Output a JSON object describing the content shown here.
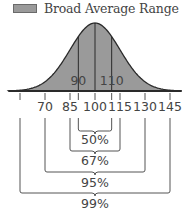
{
  "chart_data": {
    "type": "area",
    "title": "",
    "subtitle": "",
    "legend": [
      {
        "label": "Broad Average Range",
        "color": "#9a9a9a"
      }
    ],
    "legend_position": "top",
    "xlabel": "",
    "ylabel": "",
    "grid": false,
    "mean": 100,
    "sd": 15,
    "x_ticks": [
      55,
      70,
      85,
      90,
      100,
      110,
      115,
      130,
      145
    ],
    "x_tick_labels": [
      "",
      "70",
      "85",
      "",
      "100",
      "",
      "115",
      "130",
      "145"
    ],
    "inner_labels": [
      {
        "x": 90,
        "label": "90"
      },
      {
        "x": 110,
        "label": "110"
      }
    ],
    "vertical_lines": [
      90,
      100,
      110
    ],
    "ranges": [
      {
        "from": 90,
        "to": 110,
        "label": "50%",
        "percent": 50
      },
      {
        "from": 85,
        "to": 115,
        "label": "67%",
        "percent": 67
      },
      {
        "from": 70,
        "to": 130,
        "label": "95%",
        "percent": 95
      },
      {
        "from": 55,
        "to": 145,
        "label": "99%",
        "percent": 99
      }
    ],
    "colors": {
      "fill": "#9a9a9a",
      "stroke": "#2a2a2a",
      "bracket": "#555555",
      "text": "#444444"
    }
  }
}
